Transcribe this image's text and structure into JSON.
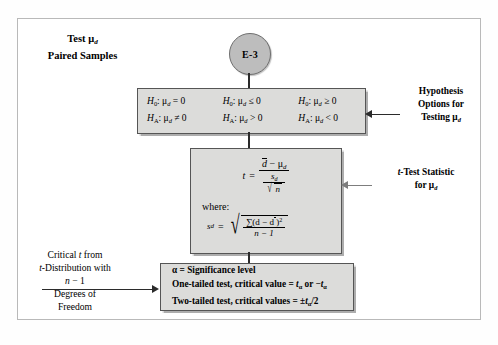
{
  "diagram": {
    "title_line1": "Test μ",
    "title_sub1": "d",
    "title_line2": "Paired Samples",
    "node_label": "E-3",
    "hypotheses": [
      {
        "null": "H",
        "null_sub": "0",
        "null_rest": ": μ",
        "null_var": "d",
        "null_rel": " = 0",
        "alt": "H",
        "alt_sub": "A",
        "alt_rest": ": μ",
        "alt_var": "d",
        "alt_rel": " ≠ 0"
      },
      {
        "null": "H",
        "null_sub": "0",
        "null_rest": ": μ",
        "null_var": "d",
        "null_rel": " ≤ 0",
        "alt": "H",
        "alt_sub": "A",
        "alt_rest": ": μ",
        "alt_var": "d",
        "alt_rel": " > 0"
      },
      {
        "null": "H",
        "null_sub": "0",
        "null_rest": ": μ",
        "null_var": "d",
        "null_rel": " ≥ 0",
        "alt": "H",
        "alt_sub": "A",
        "alt_rest": ": μ",
        "alt_var": "d",
        "alt_rel": " < 0"
      }
    ],
    "formula": {
      "t_symbol": "t",
      "equals": "=",
      "numerator_dbar": "d",
      "numerator_rest": " − μ",
      "numerator_sub": "d",
      "denominator_s": "s",
      "denominator_s_sub": "d",
      "denominator_sqrt": "n",
      "where_label": "where:",
      "sd_symbol": "s",
      "sd_sub": "d",
      "sd_equals": "=",
      "sd_num_sigma": "∑(d − d",
      "sd_num_close": ")",
      "sd_num_power": "2",
      "sd_den": "n − 1"
    },
    "critical_box": {
      "line1_alpha": "α",
      "line1_rest": " = Significance level",
      "line2_pre": "One-tailed test, critical value = ",
      "line2_t1": "t",
      "line2_sub1": "α",
      "line2_mid": " or −",
      "line2_t2": "t",
      "line2_sub2": "α",
      "line3_pre": "Two-tailed test, critical values = ",
      "line3_pm": "±",
      "line3_t": "t",
      "line3_sub": "α",
      "line3_post": "/2"
    },
    "annotation_right_top": {
      "line1": "Hypothesis",
      "line2": "Options for",
      "line3": "Testing μ",
      "line3_sub": "d"
    },
    "annotation_right_mid": {
      "line1_t": "t",
      "line1_rest": "-Test Statistic",
      "line2": "for μ",
      "line2_sub": "d"
    },
    "annotation_left": {
      "line1_pre": "Critical ",
      "line1_t": "t",
      "line1_post": " from",
      "line2_t": "t",
      "line2_rest": "-Distribution with",
      "line3_n": "n",
      "line3_rest": " − 1",
      "line4": "Degrees of",
      "line5": "Freedom"
    }
  },
  "colors": {
    "box_fill": "#dcdcda",
    "node_fill": "#bdbdbd",
    "line": "#2b2b2b",
    "frame_border": "#b9b9b9"
  }
}
